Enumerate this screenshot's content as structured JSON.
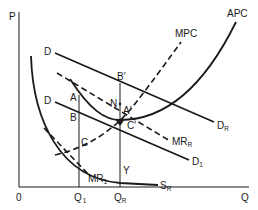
{
  "diagram": {
    "axes": {
      "y_label": "P",
      "x_label": "Q",
      "origin_label": "0",
      "x_ticks": [
        {
          "label": "Q",
          "sub": "1"
        },
        {
          "label": "Q",
          "sub": "R"
        }
      ]
    },
    "curves": [
      {
        "name": "D",
        "label": "D",
        "end_label": "D",
        "end_sub": "R",
        "style": "solid"
      },
      {
        "name": "D1",
        "label": "D",
        "end_label": "D",
        "end_sub": "1",
        "style": "solid"
      },
      {
        "name": "APC",
        "label": "APC",
        "style": "solid"
      },
      {
        "name": "MPC",
        "label": "MPC",
        "style": "dashed"
      },
      {
        "name": "MRR",
        "label": "MR",
        "sub": "R",
        "style": "dashed"
      },
      {
        "name": "MR1",
        "label": "MR",
        "sub": "1",
        "style": "dashed"
      },
      {
        "name": "SR",
        "label": "S",
        "sub": "R",
        "style": "solid"
      }
    ],
    "points": {
      "A": "A",
      "B": "B",
      "C": "C",
      "A_prime": "A′",
      "B_prime": "B′",
      "C_prime": "C′",
      "N": "N",
      "Y": "Y"
    }
  }
}
